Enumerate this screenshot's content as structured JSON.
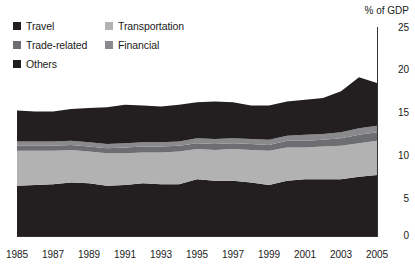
{
  "chart_data": {
    "type": "area",
    "stacked": true,
    "title": "",
    "xlabel": "",
    "ylabel": "% of GDP",
    "ylim": [
      0,
      25
    ],
    "yticks": [
      0,
      5,
      10,
      15,
      20,
      25
    ],
    "xlim": [
      1985,
      2005
    ],
    "xticks": [
      1985,
      1987,
      1989,
      1991,
      1993,
      1995,
      1997,
      1999,
      2001,
      2003,
      2005
    ],
    "grid": false,
    "legend_position": "top-left",
    "x": [
      1985,
      1986,
      1987,
      1988,
      1989,
      1990,
      1991,
      1992,
      1993,
      1994,
      1995,
      1996,
      1997,
      1998,
      1999,
      2000,
      2001,
      2002,
      2003,
      2004,
      2005
    ],
    "series": [
      {
        "name": "Travel",
        "color": "#231f20",
        "values": [
          6.0,
          6.1,
          6.2,
          6.4,
          6.3,
          6.0,
          6.1,
          6.3,
          6.2,
          6.2,
          6.8,
          6.6,
          6.6,
          6.4,
          6.1,
          6.6,
          6.8,
          6.8,
          6.8,
          7.1,
          7.3
        ]
      },
      {
        "name": "Transportation",
        "color": "#b2b2b2",
        "values": [
          4.2,
          4.1,
          4.0,
          3.9,
          3.8,
          3.9,
          3.8,
          3.7,
          3.8,
          3.9,
          3.6,
          3.7,
          3.8,
          3.9,
          4.1,
          4.0,
          3.8,
          3.9,
          4.0,
          4.0,
          4.1
        ]
      },
      {
        "name": "Trade-related",
        "color": "#6d6e71",
        "values": [
          0.6,
          0.6,
          0.6,
          0.6,
          0.6,
          0.6,
          0.7,
          0.7,
          0.7,
          0.7,
          0.7,
          0.7,
          0.7,
          0.7,
          0.7,
          0.8,
          0.8,
          0.8,
          0.9,
          1.0,
          1.0
        ]
      },
      {
        "name": "Financial",
        "color": "#8a8a8d",
        "values": [
          0.5,
          0.5,
          0.5,
          0.5,
          0.5,
          0.5,
          0.5,
          0.5,
          0.5,
          0.5,
          0.6,
          0.6,
          0.6,
          0.6,
          0.6,
          0.6,
          0.7,
          0.7,
          0.7,
          0.8,
          0.8
        ]
      },
      {
        "name": "Others",
        "color": "#231f20",
        "values": [
          3.7,
          3.6,
          3.6,
          3.8,
          4.1,
          4.4,
          4.6,
          4.4,
          4.3,
          4.4,
          4.3,
          4.5,
          4.3,
          4.0,
          4.1,
          4.1,
          4.2,
          4.3,
          4.9,
          6.1,
          5.1
        ]
      }
    ],
    "totals": [
      15.0,
      14.9,
      14.9,
      15.2,
      15.3,
      15.4,
      15.7,
      15.6,
      15.5,
      15.7,
      16.0,
      16.1,
      16.0,
      15.6,
      15.6,
      16.1,
      16.3,
      16.5,
      17.3,
      19.0,
      18.3
    ]
  },
  "legend": {
    "rows": [
      [
        {
          "label": "Travel",
          "color": "#231f20"
        },
        {
          "label": "Transportation",
          "color": "#b2b2b2"
        }
      ],
      [
        {
          "label": "Trade-related",
          "color": "#6d6e71"
        },
        {
          "label": "Financial",
          "color": "#8a8a8d"
        }
      ],
      [
        {
          "label": "Others",
          "color": "#231f20"
        }
      ]
    ]
  },
  "axes": {
    "y_title": "% of GDP",
    "y_ticks": [
      {
        "label": "25"
      },
      {
        "label": "20"
      },
      {
        "label": "15"
      },
      {
        "label": "10"
      },
      {
        "label": "5"
      },
      {
        "label": "0"
      }
    ],
    "x_ticks": [
      {
        "label": "1985"
      },
      {
        "label": "1987"
      },
      {
        "label": "1989"
      },
      {
        "label": "1991"
      },
      {
        "label": "1993"
      },
      {
        "label": "1995"
      },
      {
        "label": "1997"
      },
      {
        "label": "1999"
      },
      {
        "label": "2001"
      },
      {
        "label": "2003"
      },
      {
        "label": "2005"
      }
    ]
  }
}
